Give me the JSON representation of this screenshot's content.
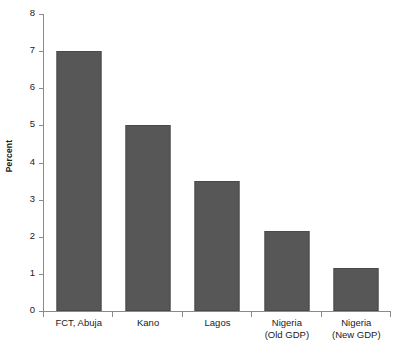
{
  "chart_data": {
    "type": "bar",
    "title": "",
    "subtitle": "",
    "xlabel": "",
    "ylabel": "Percent",
    "categories": [
      "FCT, Abuja",
      "Kano",
      "Lagos",
      "Nigeria (Old GDP)",
      "Nigeria (New GDP)"
    ],
    "category_lines": [
      [
        "FCT, Abuja"
      ],
      [
        "Kano"
      ],
      [
        "Lagos"
      ],
      [
        "Nigeria",
        "(Old GDP)"
      ],
      [
        "Nigeria",
        "(New GDP)"
      ]
    ],
    "values": [
      7.0,
      5.0,
      3.5,
      2.15,
      1.15
    ],
    "ylim": [
      0,
      8
    ],
    "yticks": [
      0,
      1,
      2,
      3,
      4,
      5,
      6,
      7,
      8
    ],
    "ytick_labels": [
      "0",
      "1",
      "2",
      "3",
      "4",
      "5",
      "6",
      "7",
      "8"
    ],
    "grid": false,
    "legend": null,
    "bar_color": "#575757",
    "bar_edge_color": "#4a4a4a",
    "axis_color": "#8a8a8a",
    "text_color": "#1a1a1a",
    "background": "#ffffff"
  }
}
